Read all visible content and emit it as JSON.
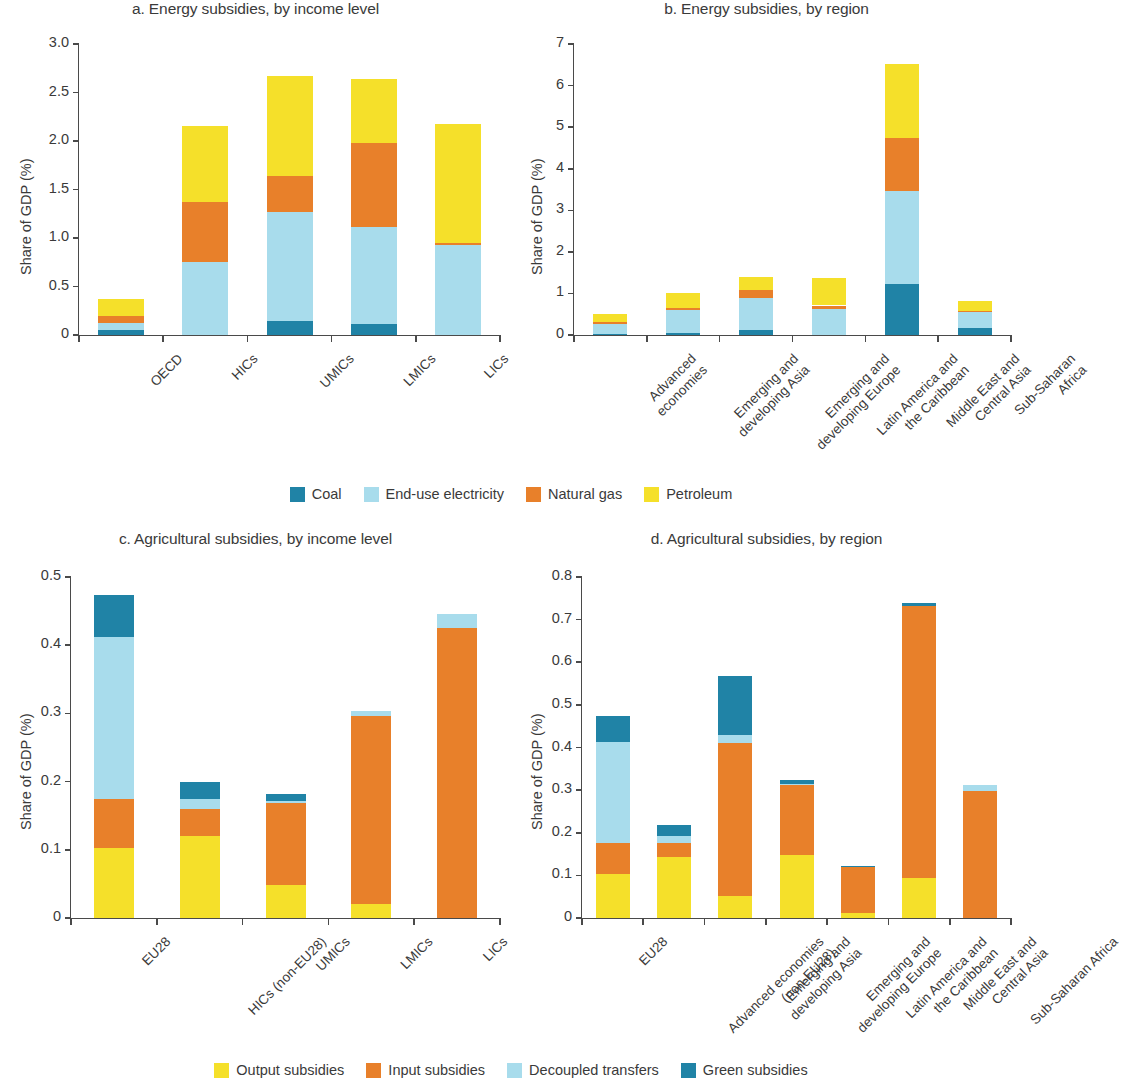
{
  "colors": {
    "coal": "#2083a6",
    "end_use_electricity": "#a8dcec",
    "natural_gas": "#e8802a",
    "petroleum": "#f5e02a",
    "output_subsidies": "#f5e02a",
    "input_subsidies": "#e8802a",
    "decoupled_transfers": "#a8dcec",
    "green_subsidies": "#2083a6",
    "axis": "#4a4a4a",
    "text": "#3a3a3a",
    "background": "#ffffff"
  },
  "energy_legend": {
    "items": [
      {
        "label": "Coal",
        "color_key": "coal"
      },
      {
        "label": "End-use electricity",
        "color_key": "end_use_electricity"
      },
      {
        "label": "Natural gas",
        "color_key": "natural_gas"
      },
      {
        "label": "Petroleum",
        "color_key": "petroleum"
      }
    ]
  },
  "agriculture_legend": {
    "items": [
      {
        "label": "Output subsidies",
        "color_key": "output_subsidies"
      },
      {
        "label": "Input subsidies",
        "color_key": "input_subsidies"
      },
      {
        "label": "Decoupled transfers",
        "color_key": "decoupled_transfers"
      },
      {
        "label": "Green subsidies",
        "color_key": "green_subsidies"
      }
    ]
  },
  "chart_data": [
    {
      "id": "panel_a",
      "type": "bar",
      "stacked": true,
      "title": "a. Energy subsidies, by income level",
      "xlabel": "",
      "ylabel": "Share of GDP (%)",
      "ylim": [
        0,
        3.0
      ],
      "yticks": [
        0,
        0.5,
        1.0,
        1.5,
        2.0,
        2.5,
        3.0
      ],
      "ytick_labels": [
        "0",
        "0.5",
        "1.0",
        "1.5",
        "2.0",
        "2.5",
        "3.0"
      ],
      "grid": false,
      "legend_position": "below-figure",
      "categories": [
        "OECD",
        "HICs",
        "UMICs",
        "LMICs",
        "LICs"
      ],
      "series": [
        {
          "name": "Coal",
          "color_key": "coal",
          "values": [
            0.05,
            0.0,
            0.14,
            0.115,
            0.0
          ]
        },
        {
          "name": "End-use electricity",
          "color_key": "end_use_electricity",
          "values": [
            0.07,
            0.75,
            1.13,
            0.995,
            0.93
          ]
        },
        {
          "name": "Natural gas",
          "color_key": "natural_gas",
          "values": [
            0.08,
            0.62,
            0.37,
            0.87,
            0.02
          ]
        },
        {
          "name": "Petroleum",
          "color_key": "petroleum",
          "values": [
            0.17,
            0.78,
            1.03,
            0.66,
            1.23
          ]
        }
      ],
      "totals": [
        0.37,
        2.15,
        2.67,
        2.64,
        2.18
      ]
    },
    {
      "id": "panel_b",
      "type": "bar",
      "stacked": true,
      "title": "b. Energy subsidies, by region",
      "xlabel": "",
      "ylabel": "Share of GDP (%)",
      "ylim": [
        0,
        7
      ],
      "yticks": [
        0,
        1,
        2,
        3,
        4,
        5,
        6,
        7
      ],
      "ytick_labels": [
        "0",
        "1",
        "2",
        "3",
        "4",
        "5",
        "6",
        "7"
      ],
      "grid": false,
      "legend_position": "below-figure",
      "categories": [
        "Advanced\neconomies",
        "Emerging and\ndeveloping Asia",
        "Emerging and\ndeveloping Europe",
        "Latin America and\nthe Caribbean",
        "Middle East and\nCentral Asia",
        "Sub-Saharan\nAfrica"
      ],
      "series": [
        {
          "name": "Coal",
          "color_key": "coal",
          "values": [
            0.02,
            0.05,
            0.11,
            0.0,
            1.22,
            0.18
          ]
        },
        {
          "name": "End-use electricity",
          "color_key": "end_use_electricity",
          "values": [
            0.24,
            0.56,
            0.78,
            0.63,
            2.24,
            0.37
          ]
        },
        {
          "name": "Natural gas",
          "color_key": "natural_gas",
          "values": [
            0.05,
            0.04,
            0.2,
            0.08,
            1.29,
            0.02
          ]
        },
        {
          "name": "Petroleum",
          "color_key": "petroleum",
          "values": [
            0.2,
            0.35,
            0.31,
            0.65,
            1.77,
            0.25
          ]
        }
      ],
      "totals": [
        0.51,
        1.0,
        1.4,
        1.36,
        6.52,
        0.82
      ]
    },
    {
      "id": "panel_c",
      "type": "bar",
      "stacked": true,
      "title": "c. Agricultural subsidies, by income level",
      "xlabel": "",
      "ylabel": "Share of GDP (%)",
      "ylim": [
        0,
        0.5
      ],
      "yticks": [
        0,
        0.1,
        0.2,
        0.3,
        0.4,
        0.5
      ],
      "ytick_labels": [
        "0",
        "0.1",
        "0.2",
        "0.3",
        "0.4",
        "0.5"
      ],
      "grid": false,
      "legend_position": "below-figure",
      "categories": [
        "EU28",
        "HICs (non-EU28)",
        "UMICs",
        "LMICs",
        "LICs"
      ],
      "series": [
        {
          "name": "Output subsidies",
          "color_key": "output_subsidies",
          "values": [
            0.103,
            0.12,
            0.049,
            0.021,
            0.0
          ]
        },
        {
          "name": "Input subsidies",
          "color_key": "input_subsidies",
          "values": [
            0.072,
            0.04,
            0.119,
            0.275,
            0.425
          ]
        },
        {
          "name": "Decoupled transfers",
          "color_key": "decoupled_transfers",
          "values": [
            0.237,
            0.015,
            0.004,
            0.008,
            0.021
          ]
        },
        {
          "name": "Green subsidies",
          "color_key": "green_subsidies",
          "values": [
            0.061,
            0.025,
            0.01,
            0.0,
            0.0
          ]
        }
      ],
      "totals": [
        0.473,
        0.2,
        0.182,
        0.304,
        0.446
      ]
    },
    {
      "id": "panel_d",
      "type": "bar",
      "stacked": true,
      "title": "d. Agricultural subsidies, by region",
      "xlabel": "",
      "ylabel": "Share of GDP (%)",
      "ylim": [
        0,
        0.8
      ],
      "yticks": [
        0,
        0.1,
        0.2,
        0.3,
        0.4,
        0.5,
        0.6,
        0.7,
        0.8
      ],
      "ytick_labels": [
        "0",
        "0.1",
        "0.2",
        "0.3",
        "0.4",
        "0.5",
        "0.6",
        "0.7",
        "0.8"
      ],
      "grid": false,
      "legend_position": "below-figure",
      "categories": [
        "EU28",
        "Advanced economies\n(non-EU28)",
        "Emerging and\ndeveloping Asia",
        "Emerging and\ndeveloping Europe",
        "Latin America and\nthe Caribbean",
        "Middle East and\nCentral Asia",
        "Sub-Saharan Africa"
      ],
      "series": [
        {
          "name": "Output subsidies",
          "color_key": "output_subsidies",
          "values": [
            0.103,
            0.142,
            0.052,
            0.148,
            0.012,
            0.095,
            0.0
          ]
        },
        {
          "name": "Input subsidies",
          "color_key": "input_subsidies",
          "values": [
            0.072,
            0.033,
            0.358,
            0.163,
            0.107,
            0.636,
            0.297
          ]
        },
        {
          "name": "Decoupled transfers",
          "color_key": "decoupled_transfers",
          "values": [
            0.237,
            0.018,
            0.02,
            0.004,
            0.0,
            0.0,
            0.016
          ]
        },
        {
          "name": "Green subsidies",
          "color_key": "green_subsidies",
          "values": [
            0.061,
            0.026,
            0.137,
            0.008,
            0.004,
            0.008,
            0.0
          ]
        }
      ],
      "totals": [
        0.473,
        0.219,
        0.567,
        0.323,
        0.123,
        0.739,
        0.313
      ]
    }
  ]
}
